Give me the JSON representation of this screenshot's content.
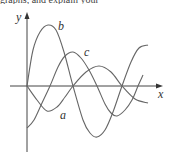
{
  "header_fragment": "graphs, and explain your",
  "chart_data": {
    "type": "line",
    "title": "",
    "xlabel": "x",
    "ylabel": "y",
    "grid": false,
    "legend": "inline curve labels",
    "axes": {
      "origin_px": [
        27,
        86
      ],
      "x_axis_px": [
        10,
        163
      ],
      "y_axis_px": [
        12,
        152
      ]
    },
    "series": [
      {
        "name": "a",
        "label_pos_px": [
          60,
          119
        ],
        "points_px": [
          [
            27,
            86
          ],
          [
            37,
            100
          ],
          [
            47,
            111
          ],
          [
            57,
            107
          ],
          [
            65,
            97
          ],
          [
            73,
            86
          ],
          [
            86,
            72
          ],
          [
            99,
            66
          ],
          [
            111,
            72
          ],
          [
            122,
            86
          ],
          [
            135,
            99
          ],
          [
            148,
            103
          ]
        ]
      },
      {
        "name": "b",
        "label_pos_px": [
          58,
          30
        ],
        "points_px": [
          [
            27,
            86
          ],
          [
            33,
            50
          ],
          [
            40,
            32
          ],
          [
            48,
            25
          ],
          [
            56,
            30
          ],
          [
            64,
            52
          ],
          [
            73,
            86
          ],
          [
            83,
            120
          ],
          [
            90,
            133
          ],
          [
            97,
            137
          ],
          [
            105,
            130
          ],
          [
            113,
            112
          ],
          [
            122,
            86
          ],
          [
            131,
            62
          ],
          [
            139,
            48
          ],
          [
            148,
            45
          ]
        ]
      },
      {
        "name": "c",
        "label_pos_px": [
          84,
          56
        ],
        "points_px": [
          [
            27,
            128
          ],
          [
            34,
            120
          ],
          [
            42,
            103
          ],
          [
            50,
            86
          ],
          [
            58,
            67
          ],
          [
            65,
            56
          ],
          [
            73,
            52
          ],
          [
            81,
            58
          ],
          [
            89,
            70
          ],
          [
            97,
            86
          ],
          [
            105,
            104
          ],
          [
            111,
            113
          ],
          [
            117,
            116
          ],
          [
            125,
            110
          ],
          [
            132,
            100
          ],
          [
            138,
            86
          ],
          [
            143,
            75
          ]
        ]
      }
    ],
    "x_ticks": [],
    "y_ticks": []
  },
  "colors": {
    "axis": "#444444",
    "curve": "#666666",
    "text": "#333333"
  }
}
